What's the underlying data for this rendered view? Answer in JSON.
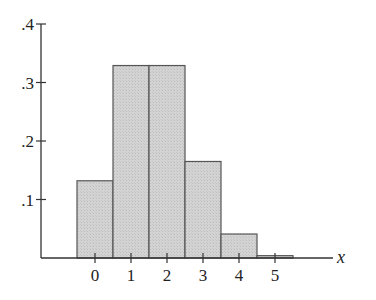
{
  "chart_data": {
    "type": "bar",
    "title": "",
    "xlabel": "x",
    "ylabel": "",
    "categories": [
      "0",
      "1",
      "2",
      "3",
      "4",
      "5"
    ],
    "values": [
      0.132,
      0.329,
      0.329,
      0.165,
      0.041,
      0.004
    ],
    "ylim": [
      0,
      0.4
    ],
    "yticks": [
      0.1,
      0.2,
      0.3,
      0.4
    ],
    "ytick_labels": [
      ".1",
      ".2",
      ".3",
      ".4"
    ],
    "xticks": [
      0,
      1,
      2,
      3,
      4,
      5
    ],
    "grid": false,
    "legend": null,
    "bar_fill": "#d0d0d0",
    "bar_edge": "#555555",
    "axis_color": "#333333"
  },
  "layout": {
    "origin_x": 41,
    "baseline_y": 258,
    "top_y": 24,
    "first_bar_left": 77,
    "bar_width": 36,
    "axis_end_x": 333
  }
}
